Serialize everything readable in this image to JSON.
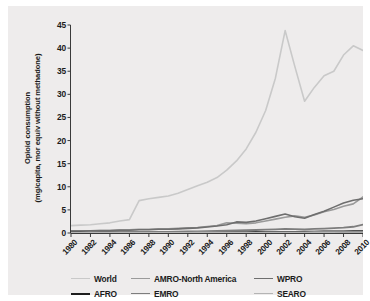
{
  "chart_data": {
    "type": "line",
    "title": "",
    "xlabel": "",
    "ylabel": "Opioid consumption\n(mg/capita, mor equiv without methadone)",
    "xlim": [
      1980,
      2010
    ],
    "ylim": [
      0,
      45
    ],
    "grid": false,
    "legend_position": "bottom",
    "x_tick_labels": [
      "1980",
      "1982",
      "1984",
      "1986",
      "1988",
      "1990",
      "1992",
      "1994",
      "1996",
      "1998",
      "2000",
      "2002",
      "2004",
      "2006",
      "2008",
      "2010"
    ],
    "y_tick_labels": [
      "0",
      "5",
      "10",
      "15",
      "20",
      "25",
      "30",
      "35",
      "40",
      "45"
    ],
    "x": [
      1980,
      1981,
      1982,
      1983,
      1984,
      1985,
      1986,
      1987,
      1988,
      1989,
      1990,
      1991,
      1992,
      1993,
      1994,
      1995,
      1996,
      1997,
      1998,
      1999,
      2000,
      2001,
      2002,
      2003,
      2004,
      2005,
      2006,
      2007,
      2008,
      2009,
      2010
    ],
    "series": [
      {
        "name": "World",
        "color": "#c9c9c9",
        "width": 1.6,
        "values": [
          1.6,
          1.7,
          1.8,
          2.0,
          2.2,
          2.6,
          2.9,
          7.0,
          7.4,
          7.7,
          8.0,
          8.6,
          9.4,
          10.2,
          11.0,
          12.0,
          13.6,
          15.6,
          18.2,
          21.8,
          26.5,
          33.5,
          43.8,
          36.0,
          28.5,
          31.5,
          34.0,
          35.0,
          38.5,
          40.5,
          39.5
        ]
      },
      {
        "name": "AMRO-North America",
        "color": "#9a9a9a",
        "width": 1.6,
        "values": [
          0.5,
          0.5,
          0.5,
          0.6,
          0.6,
          0.7,
          0.7,
          0.8,
          0.8,
          0.9,
          0.9,
          1.0,
          1.1,
          1.2,
          1.4,
          1.6,
          2.2,
          2.1,
          2.0,
          2.2,
          2.6,
          3.0,
          3.4,
          3.7,
          3.4,
          3.9,
          4.6,
          5.1,
          5.8,
          6.3,
          7.8
        ]
      },
      {
        "name": "WPRO",
        "color": "#6e6e6e",
        "width": 1.6,
        "values": [
          0.4,
          0.4,
          0.5,
          0.5,
          0.5,
          0.6,
          0.6,
          0.7,
          0.7,
          0.8,
          0.8,
          0.9,
          1.0,
          1.1,
          1.3,
          1.5,
          1.8,
          2.4,
          2.3,
          2.6,
          3.1,
          3.6,
          4.1,
          3.5,
          3.2,
          4.0,
          4.7,
          5.6,
          6.5,
          7.1,
          7.4
        ]
      },
      {
        "name": "AFRO",
        "color": "#1e1e1e",
        "width": 2.2,
        "values": [
          0.05,
          0.05,
          0.05,
          0.06,
          0.06,
          0.07,
          0.07,
          0.08,
          0.08,
          0.09,
          0.09,
          0.1,
          0.1,
          0.11,
          0.12,
          0.13,
          0.14,
          0.15,
          0.16,
          0.17,
          0.18,
          0.19,
          0.2,
          0.22,
          0.24,
          0.26,
          0.28,
          0.3,
          0.32,
          0.34,
          0.36
        ]
      },
      {
        "name": "EMRO",
        "color": "#7d7d7d",
        "width": 1.8,
        "values": [
          0.1,
          0.1,
          0.11,
          0.12,
          0.13,
          0.14,
          0.16,
          0.18,
          0.2,
          0.22,
          0.25,
          0.28,
          0.32,
          0.36,
          0.4,
          0.45,
          0.5,
          0.55,
          0.6,
          0.65,
          0.72,
          0.8,
          0.9,
          0.85,
          0.8,
          0.88,
          0.95,
          1.05,
          1.15,
          1.35,
          1.8
        ]
      },
      {
        "name": "SEARO",
        "color": "#b4b4b4",
        "width": 1.6,
        "values": [
          0.03,
          0.03,
          0.03,
          0.04,
          0.04,
          0.04,
          0.05,
          0.05,
          0.05,
          0.06,
          0.06,
          0.07,
          0.07,
          0.08,
          0.08,
          0.09,
          0.1,
          0.1,
          0.11,
          0.12,
          0.13,
          0.14,
          0.15,
          0.16,
          0.17,
          0.18,
          0.19,
          0.2,
          0.21,
          0.22,
          0.23
        ]
      }
    ]
  }
}
